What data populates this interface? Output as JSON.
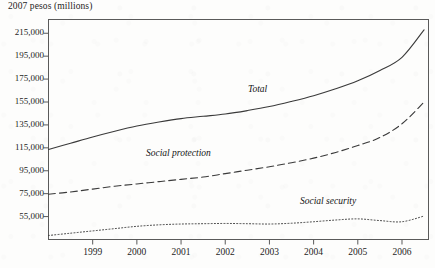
{
  "figure": {
    "axis_title": "2007 pesos (millions)",
    "background_color": "#fdfdfc",
    "ink_color": "#3a3a3a"
  },
  "series_labels": {
    "total": "Total",
    "social_protection": "Social protection",
    "social_security": "Social security"
  },
  "chart_data": {
    "type": "line",
    "title": "",
    "subtitle": "",
    "xlabel": "",
    "ylabel": "2007 pesos (millions)",
    "grid": false,
    "legend": "inline-annotations",
    "xlim": [
      1998.0,
      2006.6
    ],
    "ylim": [
      35000,
      227000
    ],
    "yticks": [
      55000,
      75000,
      95000,
      115000,
      135000,
      155000,
      175000,
      195000,
      215000
    ],
    "ytick_labels": [
      "55,000",
      "75,000",
      "95,000",
      "115,000",
      "135,000",
      "155,000",
      "175,000",
      "195,000",
      "215,000"
    ],
    "xticks": [
      1999,
      2000,
      2001,
      2002,
      2003,
      2004,
      2005,
      2006
    ],
    "xtick_labels": [
      "1999",
      "2000",
      "2001",
      "2002",
      "2003",
      "2004",
      "2005",
      "2006"
    ],
    "x": [
      1998.0,
      1998.5,
      1999.0,
      1999.5,
      2000.0,
      2000.5,
      2001.0,
      2001.5,
      2002.0,
      2002.5,
      2003.0,
      2003.5,
      2004.0,
      2004.5,
      2005.0,
      2005.5,
      2006.0,
      2006.5
    ],
    "series": [
      {
        "name": "Total",
        "style": "solid",
        "values": [
          113500,
          119000,
          124500,
          129500,
          134000,
          137500,
          140500,
          142500,
          144500,
          147500,
          151000,
          155500,
          160500,
          166500,
          173500,
          182500,
          194000,
          218000
        ]
      },
      {
        "name": "Social protection",
        "style": "dashed",
        "values": [
          74500,
          76500,
          79000,
          81500,
          83500,
          85500,
          87500,
          89500,
          92500,
          95500,
          98500,
          102000,
          106000,
          111000,
          117000,
          124000,
          136000,
          155000
        ]
      },
      {
        "name": "Social security",
        "style": "dotted",
        "values": [
          38500,
          40500,
          42500,
          44500,
          46500,
          47800,
          48500,
          48800,
          49000,
          48800,
          48500,
          49200,
          50500,
          52000,
          53000,
          51500,
          50500,
          55500
        ]
      }
    ]
  }
}
